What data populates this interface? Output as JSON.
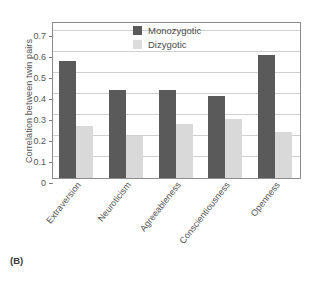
{
  "panel": {
    "label": "(B)"
  },
  "chart_data": {
    "type": "bar",
    "title": "",
    "xlabel": "",
    "ylabel": "Correlation between twin pairs",
    "ylim": [
      0,
      0.75
    ],
    "yticks": [
      "0",
      "0.1",
      "0.2",
      "0.3",
      "0.4",
      "0.5",
      "0.6",
      "0.7"
    ],
    "ytick_values": [
      0,
      0.1,
      0.2,
      0.3,
      0.4,
      0.5,
      0.6,
      0.7
    ],
    "grid": true,
    "legend_position": "top-center",
    "categories": [
      "Extraversion",
      "Neuroticism",
      "Agreeableness",
      "Conscientiousness",
      "Openness"
    ],
    "series": [
      {
        "name": "Monozygotic",
        "color": "#5a5a5a",
        "values": [
          0.56,
          0.42,
          0.42,
          0.39,
          0.59
        ]
      },
      {
        "name": "Dizygotic",
        "color": "#d9d9d9",
        "values": [
          0.25,
          0.2,
          0.26,
          0.28,
          0.22
        ]
      }
    ]
  },
  "colors": {
    "monozygotic": "#5a5a5a",
    "dizygotic": "#d9d9d9",
    "gridline": "#cfcfcf",
    "axis": "#8c8c8c",
    "text": "#4a4a4a",
    "background": "#ffffff"
  }
}
